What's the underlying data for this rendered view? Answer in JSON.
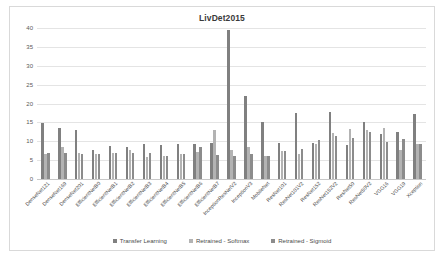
{
  "chart_data": {
    "type": "bar",
    "title": "LivDet2015",
    "xlabel": "",
    "ylabel": "",
    "ylim": [
      0,
      40
    ],
    "ytick_step": 5,
    "yticks": [
      "0",
      "5",
      "10",
      "15",
      "20",
      "25",
      "30",
      "35",
      "40"
    ],
    "grid": true,
    "legend_position": "bottom",
    "categories": [
      "DenseNet121",
      "DenseNet169",
      "DenseNet201",
      "EfficientNetB0",
      "EfficientNetB1",
      "EfficientNetB2",
      "EfficientNetB3",
      "EfficientNetB4",
      "EfficientNetB5",
      "EfficientNetB6",
      "EfficientNetB7",
      "InceptionResNetV2",
      "InceptionV3",
      "MobileNet",
      "ResNet101",
      "ResNet101V2",
      "ResNet152",
      "ResNet152V2",
      "ResNet50",
      "ResNet50V2",
      "VGG16",
      "VGG19",
      "Xception"
    ],
    "series": [
      {
        "name": "Transfer Learning",
        "color": "#808080",
        "values": [
          14.9,
          13.4,
          13.1,
          7.8,
          8.8,
          8.4,
          9.2,
          8.9,
          9.3,
          9.4,
          9.6,
          39.4,
          21.9,
          15.2,
          9.6,
          17.4,
          9.5,
          17.7,
          8.9,
          15.2,
          12.0,
          12.5,
          17.2
        ]
      },
      {
        "name": "Retrained - Softmax",
        "color": "#b3b3b3",
        "values": [
          6.7,
          8.6,
          6.9,
          6.7,
          7.0,
          7.7,
          5.9,
          6.2,
          6.6,
          7.2,
          12.9,
          7.6,
          8.6,
          6.1,
          7.5,
          6.5,
          9.4,
          12.3,
          13.3,
          12.9,
          13.5,
          7.6,
          9.2
        ]
      },
      {
        "name": "Retrained - Sigmoid",
        "color": "#8c8c8c",
        "values": [
          6.9,
          6.8,
          6.6,
          6.5,
          7.0,
          7.0,
          6.8,
          6.1,
          6.6,
          8.6,
          6.4,
          6.2,
          6.5,
          6.1,
          7.3,
          8.0,
          10.4,
          11.4,
          10.8,
          12.5,
          9.9,
          10.5,
          9.4
        ]
      }
    ]
  },
  "legend": {
    "entries": [
      {
        "label": "Transfer Learning"
      },
      {
        "label": "Retrained - Softmax"
      },
      {
        "label": "Retrained - Sigmoid"
      }
    ]
  }
}
